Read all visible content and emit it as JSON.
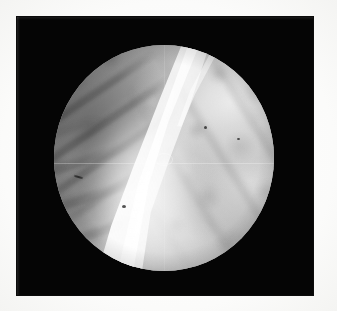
{
  "figure": {
    "kind": "endoscopic-photograph",
    "caption": "",
    "modality": "endoscopy / arthroscopy still frame",
    "colorspace": "grayscale",
    "width_px": 337,
    "height_px": 311
  },
  "canvas": {
    "background_color": "#fdfdfc",
    "plate_color": "#050505",
    "plate": {
      "x": 17,
      "y": 17,
      "width": 296,
      "height": 278
    }
  },
  "field_of_view": {
    "shape": "circle",
    "center_x": 164,
    "center_y": 158,
    "radius_x": 110,
    "radius_y": 113,
    "rim_color": "#000000",
    "mean_tissue_color": "#8d8d8d"
  },
  "regions": [
    {
      "name": "bright-wedge",
      "description": "Large bright wedge-shaped structure sweeping from upper centre to lower left",
      "tone": "highlight",
      "color": "#fbfbfb"
    },
    {
      "name": "upper-left-folds",
      "description": "Dark ridged mucosal folds in the upper-left quadrant",
      "tone": "shadow",
      "color": "#4a4a4a"
    },
    {
      "name": "right-mottled-tissue",
      "description": "Mottled mid-grey tissue surface filling the right half of the field",
      "tone": "midtone",
      "color": "#b4b4b4"
    },
    {
      "name": "lower-left-folds",
      "description": "Secondary softer folds along the lower-left rim",
      "tone": "shadow",
      "color": "#6b6b6b"
    }
  ],
  "artifacts": [
    {
      "name": "horizontal-scan-line",
      "description": "Faint horizontal reproduction line across mid-frame"
    },
    {
      "name": "vertical-scan-line",
      "description": "Faint vertical reproduction line near centre"
    },
    {
      "name": "centre-ring",
      "description": "Small pale ring artifact near image centre"
    },
    {
      "name": "dark-specks",
      "description": "Small dark debris specks over the tissue"
    },
    {
      "name": "film-grain",
      "description": "Overall halftone / film grain"
    }
  ],
  "labels": {
    "alt_text": "Grayscale endoscopic photograph: circular field of view on a black plate showing a bright wedge-shaped structure crossing mottled tissue with dark folds at upper left."
  }
}
